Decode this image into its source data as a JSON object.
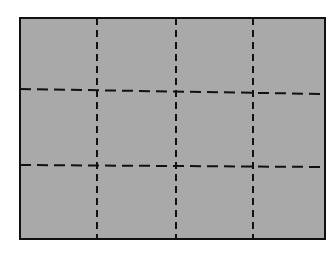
{
  "figure": {
    "columns": 4,
    "rows": 3,
    "fill_color": "#a9a9a9",
    "stroke_color": "#111111",
    "background_color": "#ffffff",
    "outer_rect": {
      "x1": 20,
      "y1": 18,
      "x2": 325,
      "y2": 239
    },
    "vertical_dividers": [
      {
        "x_top": 97,
        "x_bottom": 97
      },
      {
        "x_top": 176,
        "x_bottom": 176
      },
      {
        "x_top": 253,
        "x_bottom": 253
      }
    ],
    "horizontal_dividers": [
      {
        "y_left": 89,
        "y_right": 94
      },
      {
        "y_left": 165,
        "y_right": 167
      }
    ]
  }
}
